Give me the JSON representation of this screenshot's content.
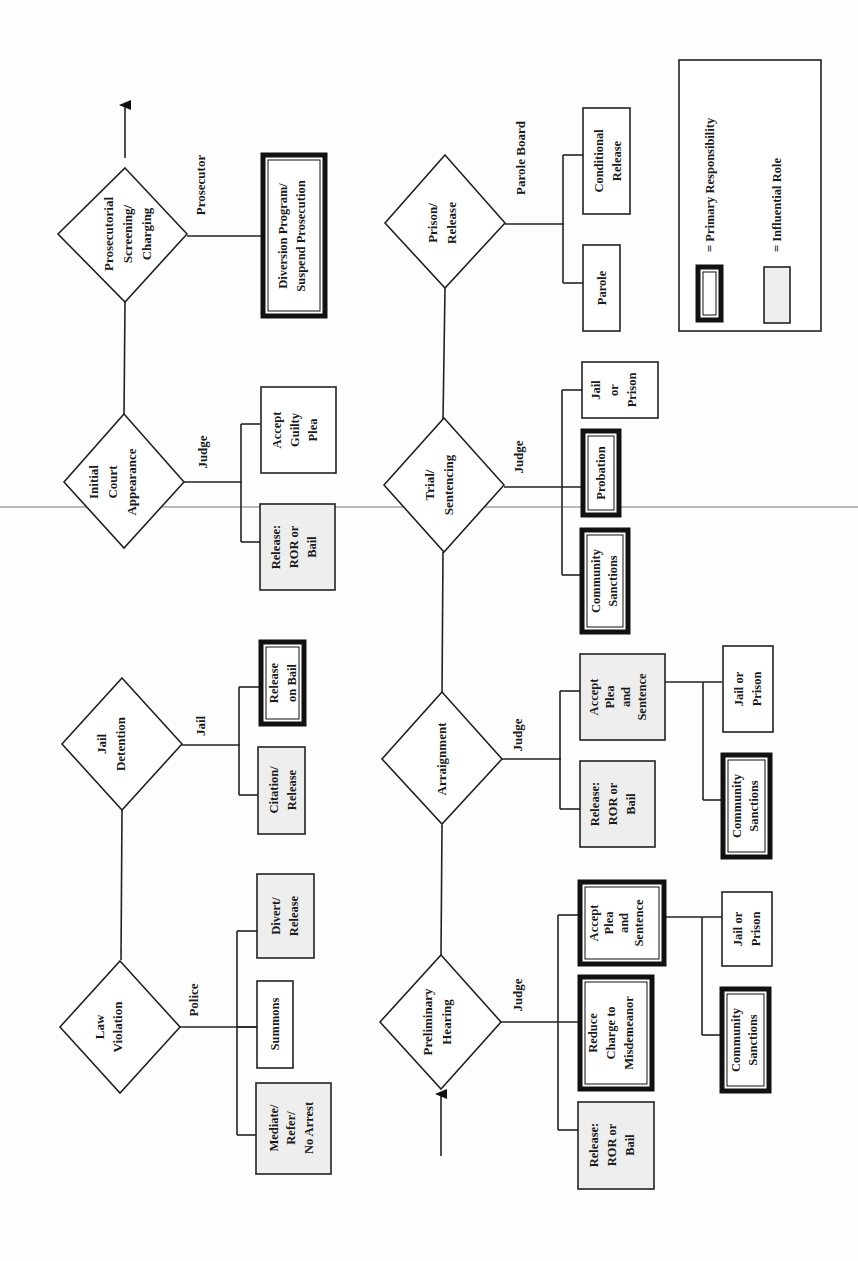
{
  "diagram": {
    "orientation": "rotated 90° counter-clockwise",
    "stages": [
      {
        "id": "law-violation",
        "label_lines": [
          "Law",
          "Violation"
        ],
        "actor": "Police",
        "options": [
          {
            "lines": [
              "Mediate/",
              "Refer/",
              "No Arrest"
            ],
            "role": "influential"
          },
          {
            "lines": [
              "Summons"
            ],
            "role": "none"
          },
          {
            "lines": [
              "Divert/",
              "Release"
            ],
            "role": "influential"
          }
        ]
      },
      {
        "id": "jail-detention",
        "label_lines": [
          "Jail",
          "Detention"
        ],
        "actor": "Jail",
        "options": [
          {
            "lines": [
              "Citation/",
              "Release"
            ],
            "role": "influential"
          },
          {
            "lines": [
              "Release",
              "on Bail"
            ],
            "role": "primary"
          }
        ]
      },
      {
        "id": "initial-court-appearance",
        "label_lines": [
          "Initial",
          "Court",
          "Appearance"
        ],
        "actor": "Judge",
        "options": [
          {
            "lines": [
              "Release:",
              "ROR or",
              "Bail"
            ],
            "role": "influential"
          },
          {
            "lines": [
              "Accept",
              "Guilty",
              "Plea"
            ],
            "role": "none"
          }
        ]
      },
      {
        "id": "prosecutorial-screening",
        "label_lines": [
          "Prosecutorial",
          "Screening/",
          "Charging"
        ],
        "actor": "Prosecutor",
        "options": [
          {
            "lines": [
              "Diversion Program/",
              "Suspend Prosecution"
            ],
            "role": "primary"
          }
        ]
      },
      {
        "id": "preliminary-hearing",
        "label_lines": [
          "Preliminary",
          "Hearing"
        ],
        "actor": "Judge",
        "options": [
          {
            "lines": [
              "Release:",
              "ROR or",
              "Bail"
            ],
            "role": "influential"
          },
          {
            "lines": [
              "Reduce",
              "Charge to",
              "Misdemeanor"
            ],
            "role": "primary"
          },
          {
            "lines": [
              "Accept",
              "Plea",
              "and",
              "Sentence"
            ],
            "role": "primary"
          }
        ],
        "sub_options": [
          {
            "lines": [
              "Community",
              "Sanctions"
            ],
            "role": "primary"
          },
          {
            "lines": [
              "Jail or",
              "Prison"
            ],
            "role": "none"
          }
        ]
      },
      {
        "id": "arraignment",
        "label_lines": [
          "Arraignment"
        ],
        "actor": "Judge",
        "options": [
          {
            "lines": [
              "Release:",
              "ROR or",
              "Bail"
            ],
            "role": "influential"
          },
          {
            "lines": [
              "Accept",
              "Plea",
              "and",
              "Sentence"
            ],
            "role": "influential"
          }
        ],
        "sub_options": [
          {
            "lines": [
              "Community",
              "Sanctions"
            ],
            "role": "primary"
          },
          {
            "lines": [
              "Jail or",
              "Prison"
            ],
            "role": "none"
          }
        ]
      },
      {
        "id": "trial-sentencing",
        "label_lines": [
          "Trial/",
          "Sentencing"
        ],
        "actor": "Judge",
        "options": [
          {
            "lines": [
              "Community",
              "Sanctions"
            ],
            "role": "primary"
          },
          {
            "lines": [
              "Probation"
            ],
            "role": "primary"
          },
          {
            "lines": [
              "Jail",
              "or",
              "Prison"
            ],
            "role": "none"
          }
        ]
      },
      {
        "id": "prison-release",
        "label_lines": [
          "Prison/",
          "Release"
        ],
        "actor": "Parole  Board",
        "options": [
          {
            "lines": [
              "Parole"
            ],
            "role": "none"
          },
          {
            "lines": [
              "Conditional",
              "Release"
            ],
            "role": "none"
          }
        ]
      }
    ],
    "legend": {
      "primary": "= Primary Responsibility",
      "influential": "= Influential Role"
    },
    "colors": {
      "line": "#222222",
      "influential_fill": "#eeeeee",
      "background": "#fdfdfd"
    }
  }
}
